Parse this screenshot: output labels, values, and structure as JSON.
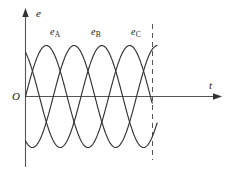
{
  "figure": {
    "name": "three-phase-emf-waveform",
    "background_color": "#ffffff",
    "stroke_color": "#333333"
  },
  "axes": {
    "y_label": "e",
    "x_label": "t",
    "origin_label": "O"
  },
  "annotations": {
    "curve_a_label_base": "e",
    "curve_a_label_sub": "A",
    "curve_b_label_base": "e",
    "curve_b_label_sub": "B",
    "curve_c_label_base": "e",
    "curve_c_label_sub": "C"
  },
  "chart_data": {
    "type": "line",
    "title": "",
    "xlabel": "t",
    "ylabel": "e",
    "grid": false,
    "legend": "inline-curve-labels",
    "xlim": [
      0,
      2.38
    ],
    "ylim": [
      -1.15,
      1.15
    ],
    "x_axis_arrow": true,
    "y_axis_arrow": true,
    "amplitude": 1,
    "period": 1,
    "phase_offsets_deg": [
      0,
      -120,
      -240
    ],
    "cycles_drawn": 2.0,
    "series": [
      {
        "name": "e_A",
        "label": "eA",
        "phase_deg": 0,
        "peak_x": 0.25,
        "color": "#333333"
      },
      {
        "name": "e_B",
        "label": "eB",
        "phase_deg": -120,
        "peak_x": 0.5833,
        "color": "#333333"
      },
      {
        "name": "e_C",
        "label": "eC",
        "phase_deg": -240,
        "peak_x": 0.9167,
        "color": "#333333"
      }
    ],
    "markers": [
      {
        "name": "cycle-end-dashed-line",
        "type": "vertical-dashed-line",
        "x": 1.5416,
        "style": "dashed"
      }
    ]
  }
}
